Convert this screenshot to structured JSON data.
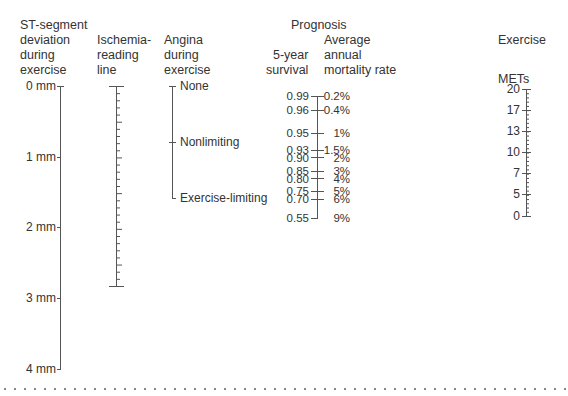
{
  "headers": {
    "st_segment": "ST-segment\ndeviation\nduring\nexercise",
    "ischemia": "Ischemia-\nreading\nline",
    "angina": "Angina\nduring\nexercise",
    "prognosis": "Prognosis",
    "survival": "5-year\nsurvival",
    "mortality": "Average\nannual\nmortality rate",
    "exercise": "Exercise",
    "mets": "METs"
  },
  "st_scale": {
    "labels": [
      "0 mm",
      "1 mm",
      "2 mm",
      "3 mm",
      "4 mm"
    ]
  },
  "angina_scale": {
    "labels": [
      "None",
      "Nonlimiting",
      "Exercise-limiting"
    ]
  },
  "prognosis_scale": {
    "survival": [
      "0.99",
      "0.96",
      "0.95",
      "0.93",
      "0.90",
      "0.85",
      "0.80",
      "0.75",
      "0.70",
      "0.55"
    ],
    "mortality": [
      "0.2%",
      "0.4%",
      "1%",
      "1.5%",
      "2%",
      "3%",
      "4%",
      "5%",
      "6%",
      "9%"
    ]
  },
  "mets_scale": {
    "labels": [
      "20",
      "17",
      "13",
      "10",
      "7",
      "5",
      "0"
    ]
  },
  "chart_data": {
    "type": "nomogram",
    "scales": [
      {
        "name": "ST-segment deviation during exercise",
        "unit": "mm",
        "ticks": [
          0,
          1,
          2,
          3,
          4
        ]
      },
      {
        "name": "Ischemia-reading line",
        "ticks": []
      },
      {
        "name": "Angina during exercise",
        "ticks": [
          "None",
          "Nonlimiting",
          "Exercise-limiting"
        ]
      },
      {
        "name": "Prognosis: 5-year survival",
        "ticks": [
          0.99,
          0.96,
          0.95,
          0.93,
          0.9,
          0.85,
          0.8,
          0.75,
          0.7,
          0.55
        ]
      },
      {
        "name": "Prognosis: Average annual mortality rate",
        "unit": "%",
        "ticks": [
          0.2,
          0.4,
          1,
          1.5,
          2,
          3,
          4,
          5,
          6,
          9
        ]
      },
      {
        "name": "Exercise METs",
        "ticks": [
          20,
          17,
          13,
          10,
          7,
          5,
          0
        ]
      }
    ]
  }
}
